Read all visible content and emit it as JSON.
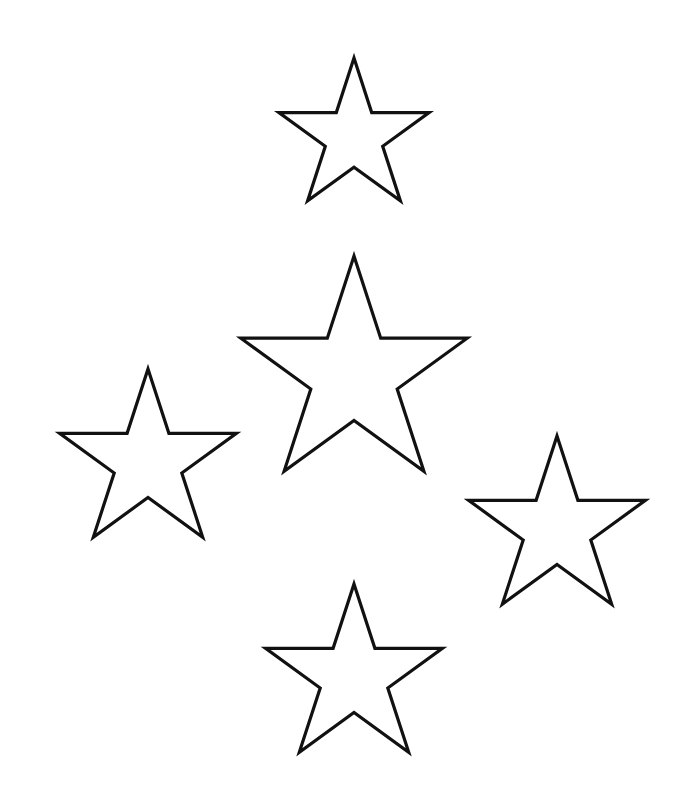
{
  "canvas": {
    "width": 687,
    "height": 791,
    "background": "#ffffff"
  },
  "style": {
    "stroke": "#111111",
    "fill": "#ffffff",
    "stroke_width": 3.2
  },
  "stars": [
    {
      "name": "star-top",
      "cx": 354,
      "cy": 137,
      "r": 79
    },
    {
      "name": "star-center",
      "cx": 354,
      "cy": 375,
      "r": 119
    },
    {
      "name": "star-left",
      "cx": 148,
      "cy": 462,
      "r": 93
    },
    {
      "name": "star-right",
      "cx": 557,
      "cy": 529,
      "r": 93
    },
    {
      "name": "star-bottom",
      "cx": 354,
      "cy": 677,
      "r": 93
    }
  ],
  "inner_ratio": 0.382
}
